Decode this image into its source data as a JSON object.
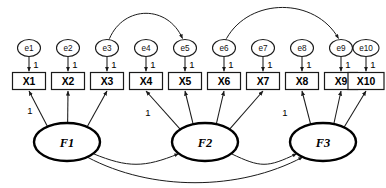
{
  "diagram": {
    "type": "sem-path-diagram",
    "background_color": "#ffffff",
    "line_color": "#1a1a1a",
    "factor_stroke_color": "#000000"
  },
  "errors": [
    {
      "id": "e1",
      "label": "e1",
      "cx": 29,
      "cy": 48,
      "rx": 11.5,
      "ry": 8.5
    },
    {
      "id": "e2",
      "label": "e2",
      "cx": 68,
      "cy": 48,
      "rx": 11.5,
      "ry": 8.5
    },
    {
      "id": "e3",
      "label": "e3",
      "cx": 107,
      "cy": 48,
      "rx": 11.5,
      "ry": 8.5
    },
    {
      "id": "e4",
      "label": "e4",
      "cx": 146,
      "cy": 48,
      "rx": 11.5,
      "ry": 8.5
    },
    {
      "id": "e5",
      "label": "e5",
      "cx": 185,
      "cy": 48,
      "rx": 11.5,
      "ry": 8.5
    },
    {
      "id": "e6",
      "label": "e6",
      "cx": 224,
      "cy": 48,
      "rx": 11.5,
      "ry": 8.5
    },
    {
      "id": "e7",
      "label": "e7",
      "cx": 263,
      "cy": 48,
      "rx": 11.5,
      "ry": 8.5
    },
    {
      "id": "e8",
      "label": "e8",
      "cx": 302,
      "cy": 48,
      "rx": 11.5,
      "ry": 8.5
    },
    {
      "id": "e9",
      "label": "e9",
      "cx": 341,
      "cy": 48,
      "rx": 11.5,
      "ry": 8.5
    },
    {
      "id": "e10",
      "label": "e10",
      "cx": 366,
      "cy": 48,
      "rx": 13.0,
      "ry": 8.5
    }
  ],
  "observed": [
    {
      "id": "X1",
      "label": "X1",
      "cx": 29,
      "cy": 81,
      "w": 33,
      "h": 17
    },
    {
      "id": "X2",
      "label": "X2",
      "cx": 68,
      "cy": 81,
      "w": 33,
      "h": 17
    },
    {
      "id": "X3",
      "label": "X3",
      "cx": 107,
      "cy": 81,
      "w": 33,
      "h": 17
    },
    {
      "id": "X4",
      "label": "X4",
      "cx": 146,
      "cy": 81,
      "w": 33,
      "h": 17
    },
    {
      "id": "X5",
      "label": "X5",
      "cx": 185,
      "cy": 81,
      "w": 33,
      "h": 17
    },
    {
      "id": "X6",
      "label": "X6",
      "cx": 224,
      "cy": 81,
      "w": 33,
      "h": 17
    },
    {
      "id": "X7",
      "label": "X7",
      "cx": 263,
      "cy": 81,
      "w": 33,
      "h": 17
    },
    {
      "id": "X8",
      "label": "X8",
      "cx": 302,
      "cy": 81,
      "w": 33,
      "h": 17
    },
    {
      "id": "X9",
      "label": "X9",
      "cx": 341,
      "cy": 81,
      "w": 33,
      "h": 17
    },
    {
      "id": "X10",
      "label": "X10",
      "cx": 366,
      "cy": 81,
      "w": 36,
      "h": 17
    }
  ],
  "factors": [
    {
      "id": "F1",
      "label": "F1",
      "cx": 67,
      "cy": 142,
      "rx": 33,
      "ry": 19
    },
    {
      "id": "F2",
      "label": "F2",
      "cx": 205,
      "cy": 142,
      "rx": 33,
      "ry": 19
    },
    {
      "id": "F3",
      "label": "F3",
      "cx": 323,
      "cy": 142,
      "rx": 33,
      "ry": 19
    }
  ],
  "error_loadings": [
    {
      "from": "e1",
      "to": "X1",
      "label": "1"
    },
    {
      "from": "e2",
      "to": "X2",
      "label": "1"
    },
    {
      "from": "e3",
      "to": "X3",
      "label": "1"
    },
    {
      "from": "e4",
      "to": "X4",
      "label": "1"
    },
    {
      "from": "e5",
      "to": "X5",
      "label": "1"
    },
    {
      "from": "e6",
      "to": "X6",
      "label": "1"
    },
    {
      "from": "e7",
      "to": "X7",
      "label": "1"
    },
    {
      "from": "e8",
      "to": "X8",
      "label": "1"
    },
    {
      "from": "e9",
      "to": "X9",
      "label": "1"
    },
    {
      "from": "e10",
      "to": "X10",
      "label": "1"
    }
  ],
  "factor_loadings": [
    {
      "from": "F1",
      "to": "X1",
      "label": "1"
    },
    {
      "from": "F1",
      "to": "X2",
      "label": ""
    },
    {
      "from": "F1",
      "to": "X3",
      "label": ""
    },
    {
      "from": "F2",
      "to": "X4",
      "label": "1"
    },
    {
      "from": "F2",
      "to": "X5",
      "label": ""
    },
    {
      "from": "F2",
      "to": "X6",
      "label": ""
    },
    {
      "from": "F2",
      "to": "X7",
      "label": ""
    },
    {
      "from": "F3",
      "to": "X8",
      "label": "1"
    },
    {
      "from": "F3",
      "to": "X9",
      "label": ""
    },
    {
      "from": "F3",
      "to": "X10",
      "label": ""
    }
  ],
  "error_correlations": [
    {
      "from": "e3",
      "to": "e5"
    },
    {
      "from": "e6",
      "to": "e9"
    }
  ],
  "factor_correlations": [
    {
      "from": "F1",
      "to": "F2"
    },
    {
      "from": "F2",
      "to": "F3"
    },
    {
      "from": "F1",
      "to": "F3"
    }
  ],
  "loading_one_labels": [
    {
      "for": "X1",
      "text": "1",
      "x": 30,
      "y": 110
    },
    {
      "for": "X4",
      "text": "1",
      "x": 148,
      "y": 112
    },
    {
      "for": "X8",
      "text": "1",
      "x": 285,
      "y": 112
    }
  ],
  "error_one_labels": [
    {
      "for": "e1",
      "text": "1",
      "x": 36,
      "y": 64
    },
    {
      "for": "e2",
      "text": "1",
      "x": 75,
      "y": 64
    },
    {
      "for": "e3",
      "text": "1",
      "x": 114,
      "y": 64
    },
    {
      "for": "e4",
      "text": "1",
      "x": 153,
      "y": 64
    },
    {
      "for": "e5",
      "text": "1",
      "x": 192,
      "y": 64
    },
    {
      "for": "e6",
      "text": "1",
      "x": 231,
      "y": 64
    },
    {
      "for": "e7",
      "text": "1",
      "x": 270,
      "y": 64
    },
    {
      "for": "e8",
      "text": "1",
      "x": 309,
      "y": 64
    },
    {
      "for": "e9",
      "text": "1",
      "x": 348,
      "y": 64
    },
    {
      "for": "e10",
      "text": "1",
      "x": 373,
      "y": 64
    }
  ]
}
